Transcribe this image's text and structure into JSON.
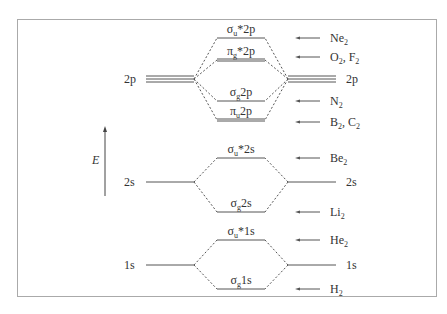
{
  "diagram": {
    "type": "molecular-orbital-energy-level-diagram",
    "axis": {
      "label": "E",
      "direction": "up"
    },
    "atomic_orbitals": {
      "left": [
        {
          "id": "2p",
          "label": "2p",
          "y": 79,
          "degeneracy": 3
        },
        {
          "id": "2s",
          "label": "2s",
          "y": 182,
          "degeneracy": 1
        },
        {
          "id": "1s",
          "label": "1s",
          "y": 265,
          "degeneracy": 1
        }
      ],
      "right": [
        {
          "id": "2p",
          "label": "2p",
          "y": 79,
          "degeneracy": 3
        },
        {
          "id": "2s",
          "label": "2s",
          "y": 182,
          "degeneracy": 1
        },
        {
          "id": "1s",
          "label": "1s",
          "y": 265,
          "degeneracy": 1
        }
      ]
    },
    "molecular_orbitals": [
      {
        "id": "sigma_u_star_2p",
        "sym": "σ",
        "sub": "u",
        "sup": "*",
        "tail": "2p",
        "y": 38,
        "degeneracy": 1
      },
      {
        "id": "pi_g_star_2p",
        "sym": "π",
        "sub": "g",
        "sup": "*",
        "tail": "2p",
        "y": 60,
        "degeneracy": 2
      },
      {
        "id": "sigma_g_2p",
        "sym": "σ",
        "sub": "g",
        "sup": "",
        "tail": "2p",
        "y": 101,
        "degeneracy": 1
      },
      {
        "id": "pi_u_2p",
        "sym": "π",
        "sub": "u",
        "sup": "",
        "tail": "2p",
        "y": 120,
        "degeneracy": 2
      },
      {
        "id": "sigma_u_star_2s",
        "sym": "σ",
        "sub": "u",
        "sup": "*",
        "tail": "2s",
        "y": 158,
        "degeneracy": 1
      },
      {
        "id": "sigma_g_2s",
        "sym": "σ",
        "sub": "g",
        "sup": "",
        "tail": "2s",
        "y": 212,
        "degeneracy": 1
      },
      {
        "id": "sigma_u_star_1s",
        "sym": "σ",
        "sub": "u",
        "sup": "*",
        "tail": "1s",
        "y": 240,
        "degeneracy": 1
      },
      {
        "id": "sigma_g_1s",
        "sym": "σ",
        "sub": "g",
        "sup": "",
        "tail": "1s",
        "y": 289,
        "degeneracy": 1
      }
    ],
    "molecule_markers": [
      {
        "label": "Ne",
        "sub": "2",
        "rest": "",
        "y": 38
      },
      {
        "label": "O",
        "sub": "2",
        "rest": ", F",
        "rest_sub": "2",
        "y": 57
      },
      {
        "label": "N",
        "sub": "2",
        "rest": "",
        "y": 101
      },
      {
        "label": "B",
        "sub": "2",
        "rest": ", C",
        "rest_sub": "2",
        "y": 122
      },
      {
        "label": "Be",
        "sub": "2",
        "rest": "",
        "y": 158
      },
      {
        "label": "Li",
        "sub": "2",
        "rest": "",
        "y": 212
      },
      {
        "label": "He",
        "sub": "2",
        "rest": "",
        "y": 240
      },
      {
        "label": "H",
        "sub": "2",
        "rest": "",
        "y": 289
      }
    ],
    "colors": {
      "line": "#555555",
      "text": "#333333",
      "frame": "#aaaaaa",
      "background": "#ffffff"
    }
  }
}
